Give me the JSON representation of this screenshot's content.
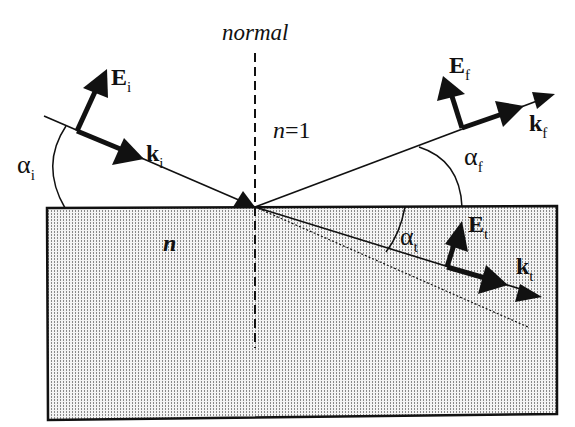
{
  "diagram": {
    "labels": {
      "normal": "normal",
      "n_outside": "n=1",
      "n_outside_var": "n",
      "n_outside_eq": "=1",
      "n_medium": "n"
    },
    "vectors": {
      "incident_E": {
        "main": "E",
        "sub": "i"
      },
      "incident_k": {
        "main": "k",
        "sub": "i"
      },
      "reflected_E": {
        "main": "E",
        "sub": "f"
      },
      "reflected_k": {
        "main": "k",
        "sub": "f"
      },
      "transmitted_E": {
        "main": "E",
        "sub": "t"
      },
      "transmitted_k": {
        "main": "k",
        "sub": "t"
      }
    },
    "angles": {
      "incident": {
        "main": "α",
        "sub": "i"
      },
      "reflected": {
        "main": "α",
        "sub": "f"
      },
      "transmitted": {
        "main": "α",
        "sub": "t"
      }
    },
    "colors": {
      "ink": "#111111",
      "medium_fill": "#d9d9d9",
      "background": "#ffffff"
    }
  }
}
